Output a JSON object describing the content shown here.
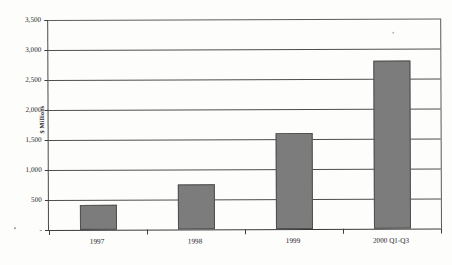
{
  "chart_data": {
    "type": "bar",
    "title": "",
    "xlabel": "",
    "ylabel": "$ Millions",
    "categories": [
      "1997",
      "1998",
      "1999",
      "2000 Q1-Q3"
    ],
    "values": [
      420,
      750,
      1600,
      2800
    ],
    "series": [
      {
        "name": "Revenue",
        "values": [
          420,
          750,
          1600,
          2800
        ]
      }
    ],
    "ylim": [
      0,
      3500
    ],
    "ytick_values": [
      0,
      500,
      1000,
      1500,
      2000,
      2500,
      3000,
      3500
    ],
    "ytick_labels": [
      "-",
      "500",
      "1,000",
      "1,500",
      "2,000",
      "2,500",
      "3,000",
      "3,500"
    ],
    "grid": true,
    "legend": false,
    "legend_position": "none",
    "bar_color": "#7c7c7c",
    "bar_border_color": "#4f4f4f",
    "axis_color": "#3d3d3d",
    "gridline_color": "#4e4e4e",
    "background_color": "#fdfdfc"
  }
}
